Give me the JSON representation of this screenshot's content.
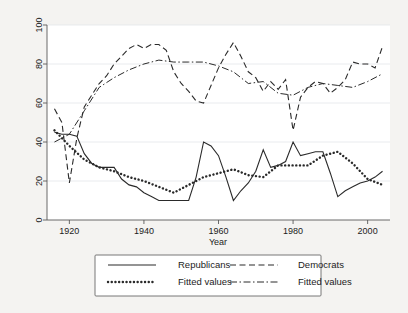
{
  "chart_data": {
    "type": "line",
    "title": "",
    "subtitle": "",
    "xlabel": "Year",
    "ylabel": "",
    "xlim": [
      1914,
      2006
    ],
    "ylim": [
      0,
      100
    ],
    "xticks": [
      1920,
      1940,
      1960,
      1980,
      2000
    ],
    "yticks": [
      0,
      20,
      40,
      60,
      80,
      100
    ],
    "xtick_labels": [
      "1920",
      "1940",
      "1960",
      "1980",
      "2000"
    ],
    "ytick_labels": [
      "0",
      "20",
      "40",
      "60",
      "80",
      "100"
    ],
    "grid": "horizontal",
    "legend_position": "below-plot",
    "series": [
      {
        "name": "Republicans",
        "style": "solid",
        "x": [
          1916,
          1918,
          1920,
          1922,
          1924,
          1926,
          1928,
          1930,
          1932,
          1934,
          1936,
          1938,
          1940,
          1942,
          1944,
          1946,
          1948,
          1950,
          1952,
          1954,
          1956,
          1958,
          1960,
          1962,
          1964,
          1966,
          1968,
          1970,
          1972,
          1974,
          1976,
          1978,
          1980,
          1982,
          1984,
          1986,
          1988,
          1990,
          1992,
          1994,
          1996,
          1998,
          2000,
          2002,
          2004
        ],
        "y": [
          45,
          44,
          44,
          43,
          34,
          29,
          27,
          27,
          27,
          21,
          18,
          17,
          14,
          12,
          10,
          10,
          10,
          10,
          10,
          22,
          40,
          38,
          33,
          22,
          10,
          15,
          19,
          25,
          36,
          27,
          28,
          30,
          40,
          33,
          34,
          35,
          35,
          24,
          12,
          15,
          17,
          19,
          20,
          22,
          25
        ]
      },
      {
        "name": "Democrats",
        "style": "dashed",
        "x": [
          1916,
          1918,
          1920,
          1922,
          1924,
          1926,
          1928,
          1930,
          1932,
          1934,
          1936,
          1938,
          1940,
          1942,
          1944,
          1946,
          1948,
          1950,
          1952,
          1954,
          1956,
          1958,
          1960,
          1962,
          1964,
          1966,
          1968,
          1970,
          1972,
          1974,
          1976,
          1978,
          1980,
          1982,
          1984,
          1986,
          1988,
          1990,
          1992,
          1994,
          1996,
          1998,
          2000,
          2002,
          2004
        ],
        "y": [
          57,
          50,
          19,
          42,
          58,
          64,
          70,
          74,
          80,
          84,
          88,
          90,
          88,
          90,
          90,
          87,
          76,
          70,
          66,
          61,
          60,
          69,
          78,
          85,
          91,
          84,
          76,
          73,
          66,
          71,
          67,
          72,
          46,
          63,
          68,
          71,
          70,
          65,
          68,
          72,
          81,
          80,
          80,
          78,
          89
        ]
      },
      {
        "name": "Fitted values",
        "style": "dotted",
        "note": "fitted to Republicans",
        "x": [
          1916,
          1920,
          1924,
          1928,
          1932,
          1936,
          1940,
          1944,
          1948,
          1952,
          1956,
          1960,
          1964,
          1968,
          1972,
          1976,
          1980,
          1984,
          1988,
          1992,
          1996,
          2000,
          2004
        ],
        "y": [
          46,
          38,
          31,
          27,
          25,
          22,
          20,
          17,
          14,
          18,
          22,
          24,
          26,
          23,
          22,
          28,
          28,
          28,
          33,
          35,
          29,
          21,
          18
        ]
      },
      {
        "name": "Fitted values",
        "style": "dash-dot",
        "note": "fitted to Democrats",
        "x": [
          1916,
          1920,
          1924,
          1928,
          1932,
          1936,
          1940,
          1944,
          1948,
          1952,
          1956,
          1960,
          1964,
          1968,
          1972,
          1976,
          1980,
          1984,
          1988,
          1992,
          1996,
          2000,
          2004
        ],
        "y": [
          40,
          44,
          56,
          68,
          73,
          77,
          80,
          82,
          81,
          81,
          81,
          79,
          76,
          70,
          71,
          65,
          64,
          68,
          70,
          69,
          68,
          71,
          75
        ]
      }
    ]
  },
  "axis": {
    "x_title": "Year"
  },
  "legend": {
    "entries": [
      {
        "label": "Republicans",
        "style": "solid"
      },
      {
        "label": "Democrats",
        "style": "dashed"
      },
      {
        "label": "Fitted values",
        "style": "dotted"
      },
      {
        "label": "Fitted values",
        "style": "dash-dot"
      }
    ]
  }
}
